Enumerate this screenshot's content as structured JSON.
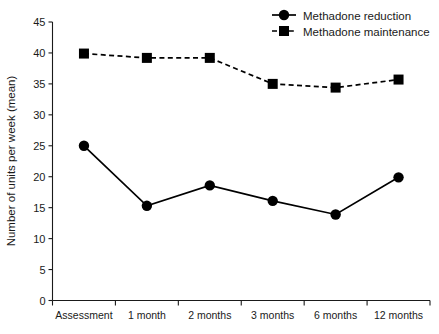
{
  "chart_data": {
    "type": "line",
    "title": "",
    "xlabel": "",
    "ylabel": "Number of units per week (mean)",
    "categories": [
      "Assessment",
      "1 month",
      "2 months",
      "3 months",
      "6 months",
      "12 months"
    ],
    "ylim": [
      0,
      45
    ],
    "yticks": [
      0,
      5,
      10,
      15,
      20,
      25,
      30,
      35,
      40,
      45
    ],
    "ytick_labels": [
      "0",
      "5",
      "10",
      "15",
      "20",
      "25",
      "30",
      "35",
      "40",
      "45"
    ],
    "grid": false,
    "legend_position": "top-right",
    "series": [
      {
        "name": "Methadone reduction",
        "marker": "circle",
        "linestyle": "solid",
        "color": "#000000",
        "values": [
          25.0,
          15.3,
          18.6,
          16.1,
          13.9,
          19.9
        ]
      },
      {
        "name": "Methadone maintenance",
        "marker": "square",
        "linestyle": "dashed",
        "color": "#000000",
        "values": [
          39.9,
          39.2,
          39.2,
          35.0,
          34.4,
          35.7
        ]
      }
    ]
  },
  "legend": {
    "items": [
      {
        "label": "Methadone reduction"
      },
      {
        "label": "Methadone maintenance"
      }
    ]
  }
}
